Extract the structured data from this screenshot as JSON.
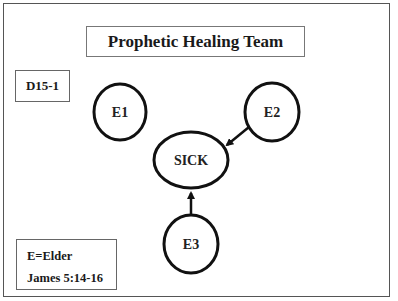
{
  "diagram": {
    "title": "Prophetic Healing Team",
    "code": "D15-1",
    "legend": {
      "line1": "E=Elder",
      "line2": "James 5:14-16"
    },
    "nodes": [
      {
        "id": "E1",
        "label": "E1"
      },
      {
        "id": "E2",
        "label": "E2"
      },
      {
        "id": "SICK",
        "label": "SICK"
      },
      {
        "id": "E3",
        "label": "E3"
      }
    ],
    "edges": [
      {
        "from": "E2",
        "to": "SICK"
      },
      {
        "from": "E3",
        "to": "SICK"
      }
    ],
    "colors": {
      "stroke": "#111111",
      "background": "#ffffff"
    }
  }
}
